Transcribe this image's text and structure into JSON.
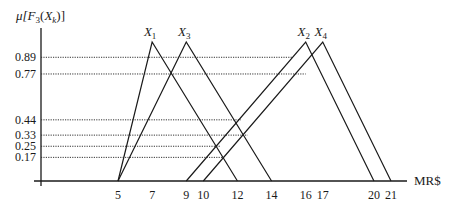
{
  "chart_data": {
    "type": "line",
    "title": "",
    "ylabel": "μ[F3(Xk)]",
    "ylabel_parts": {
      "mu": "μ[",
      "F": "F",
      "F_sub": "3",
      "open": "(",
      "X": "X",
      "X_sub": "k",
      "close": ")]"
    },
    "xlabel": "MR$",
    "x_ticks": [
      5,
      7,
      9,
      10,
      12,
      14,
      16,
      17,
      20,
      21
    ],
    "y_ticks": [
      0.89,
      0.77,
      0.44,
      0.33,
      0.25,
      0.17
    ],
    "y_tick_labels": [
      "0.89",
      "0.77",
      "0.44",
      "0.33",
      "0.25",
      "0.17"
    ],
    "ylim": [
      0,
      1
    ],
    "xlim": [
      0,
      22
    ],
    "grid": false,
    "legend": "inline labels at triangle peaks",
    "series": [
      {
        "name": "X1",
        "label": "X",
        "sub": "1",
        "shape": "triangular",
        "x": [
          5,
          7,
          12
        ],
        "y": [
          0,
          1,
          0
        ]
      },
      {
        "name": "X3",
        "label": "X",
        "sub": "3",
        "shape": "triangular",
        "x": [
          5,
          9,
          14
        ],
        "y": [
          0,
          1,
          0
        ]
      },
      {
        "name": "X2",
        "label": "X",
        "sub": "2",
        "shape": "triangular",
        "x": [
          9,
          16,
          20
        ],
        "y": [
          0,
          1,
          0
        ]
      },
      {
        "name": "X4",
        "label": "X",
        "sub": "4",
        "shape": "triangular",
        "x": [
          10,
          17,
          21
        ],
        "y": [
          0,
          1,
          0
        ]
      }
    ],
    "reference_lines": [
      {
        "y": 0.89,
        "to_x": 15.2
      },
      {
        "y": 0.77,
        "to_x": 16.0
      },
      {
        "y": 0.44,
        "to_x": 12.2
      },
      {
        "y": 0.33,
        "to_x": 12.6
      },
      {
        "y": 0.25,
        "to_x": 11.0
      },
      {
        "y": 0.17,
        "to_x": 11.2
      }
    ],
    "colors": {
      "line": "#1a1a1a",
      "dotted": "#333333",
      "background": "#ffffff"
    }
  }
}
